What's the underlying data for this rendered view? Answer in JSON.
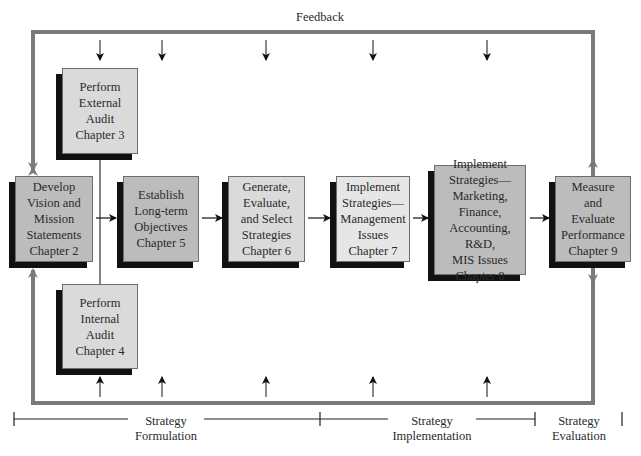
{
  "diagram": {
    "feedback_label": "Feedback",
    "boxes": [
      {
        "id": "external-audit",
        "text": "Perform\nExternal\nAudit\nChapter 3"
      },
      {
        "id": "vision-mission",
        "text": "Develop\nVision and\nMission\nStatements\nChapter 2"
      },
      {
        "id": "objectives",
        "text": "Establish\nLong-term\nObjectives\nChapter 5"
      },
      {
        "id": "generate-strategies",
        "text": "Generate,\nEvaluate,\nand Select\nStrategies\nChapter 6"
      },
      {
        "id": "implement-management",
        "text": "Implement\nStrategies—\nManagement\nIssues\nChapter 7"
      },
      {
        "id": "implement-functional",
        "text": "Implement\nStrategies—\nMarketing,\nFinance,\nAccounting, R&D,\nMIS Issues\nChapter 8"
      },
      {
        "id": "measure-evaluate",
        "text": "Measure\nand\nEvaluate\nPerformance\nChapter 9"
      },
      {
        "id": "internal-audit",
        "text": "Perform\nInternal\nAudit\nChapter 4"
      }
    ],
    "phases": [
      {
        "id": "formulation",
        "label": "Strategy\nFormulation"
      },
      {
        "id": "implementation",
        "label": "Strategy\nImplementation"
      },
      {
        "id": "evaluation",
        "label": "Strategy\nEvaluation"
      }
    ],
    "colors": {
      "feedback_line": "#7a7a7a",
      "box_dark": "#bcbcbc",
      "box_light": "#dadada",
      "box_lighter": "#e6e6e6",
      "shadow": "#111111"
    }
  }
}
